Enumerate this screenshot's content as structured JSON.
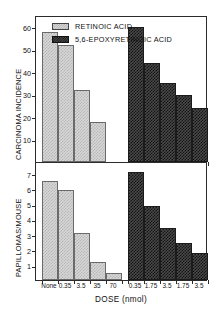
{
  "chart_data": [
    {
      "type": "bar",
      "panel": "top",
      "title": "",
      "ylabel": "CARCINOMA INCIDENCE",
      "xlabel": "DOSE (nmol)",
      "ylim": [
        0,
        65
      ],
      "yticks": [
        10,
        20,
        30,
        40,
        50,
        60
      ],
      "grid": false,
      "legend_position": "top-center",
      "groups": [
        {
          "series": "RETINOIC ACID",
          "fill": "light",
          "categories": [
            "None",
            "0.35",
            "3.5",
            "35"
          ],
          "values": [
            58,
            52,
            32,
            18
          ]
        },
        {
          "series": "5,6-EPOXYRETINOIC ACID",
          "fill": "dark",
          "categories": [
            "0.35",
            "1.75",
            "3.5",
            "1.75",
            "3.5"
          ],
          "values": [
            60,
            44,
            35,
            30,
            24
          ]
        }
      ]
    },
    {
      "type": "bar",
      "panel": "bottom",
      "title": "",
      "ylabel": "PAPILLOMAS/MOUSE",
      "xlabel": "DOSE (nmol)",
      "ylim": [
        0,
        7.8
      ],
      "yticks": [
        1,
        2,
        3,
        4,
        5,
        6,
        7
      ],
      "grid": false,
      "groups": [
        {
          "series": "RETINOIC ACID",
          "fill": "light",
          "categories": [
            "None",
            "0.35",
            "3.5",
            "35",
            "70"
          ],
          "values": [
            6.5,
            5.9,
            3.1,
            1.2,
            0.45
          ]
        },
        {
          "series": "5,6-EPOXYRETINOIC ACID",
          "fill": "dark",
          "categories": [
            "0.35",
            "1.75",
            "3.5",
            "1.75",
            "3.5"
          ],
          "values": [
            7.1,
            4.85,
            3.4,
            2.45,
            1.8
          ]
        }
      ]
    }
  ],
  "legend": {
    "items": [
      {
        "label": "RETINOIC ACID",
        "fill": "light"
      },
      {
        "label": "5,6-EPOXYRETINOIC ACID",
        "fill": "dark"
      }
    ]
  },
  "axes": {
    "top": {
      "ylabel": "CARCINOMA INCIDENCE",
      "ytick_labels": [
        "60",
        "50",
        "40",
        "30",
        "20",
        "10"
      ]
    },
    "bottom": {
      "ylabel": "PAPILLOMAS/MOUSE",
      "ytick_labels": [
        "7",
        "6",
        "5",
        "4",
        "3",
        "2",
        "1"
      ]
    },
    "x": {
      "title": "DOSE (nmol)",
      "tick_labels": [
        "None",
        "0.35",
        "3.5",
        "35",
        "70",
        "0.35",
        "1.75",
        "3.5",
        "1.75",
        "3.5"
      ]
    }
  }
}
